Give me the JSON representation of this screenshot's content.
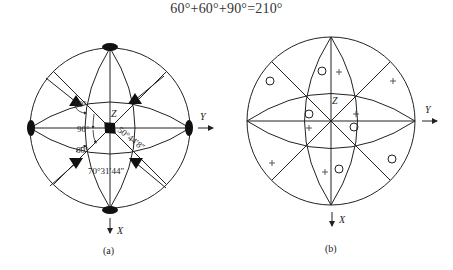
{
  "formula": "60°+60°+90°=210°",
  "figure_a": {
    "caption": "(a)",
    "axis_labels": {
      "z": "Z",
      "y": "Y",
      "x": "X"
    },
    "angles": {
      "upper_left": "60°",
      "middle_left": "90°",
      "lower_left": "60°",
      "diagonal": "50°44′8″",
      "bottom": "70°31′44″"
    },
    "symbols": {
      "poles": "filled-ellipse (4-fold axes)",
      "triangles": "filled-triangle (3-fold axes)",
      "center": "filled-diamond"
    }
  },
  "figure_b": {
    "caption": "(b)",
    "axis_labels": {
      "z": "Z",
      "y": "Y",
      "x": "X"
    },
    "symbols": {
      "open_circles": 6,
      "plus_signs": 6
    }
  }
}
